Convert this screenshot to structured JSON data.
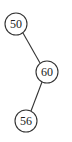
{
  "diagram": {
    "type": "binary-tree",
    "nodes": [
      {
        "id": "n50",
        "label": "50",
        "cx": 16,
        "cy": 24,
        "r": 11
      },
      {
        "id": "n60",
        "label": "60",
        "cx": 47,
        "cy": 72,
        "r": 11
      },
      {
        "id": "n56",
        "label": "56",
        "cx": 26,
        "cy": 121,
        "r": 11
      }
    ],
    "edges": [
      {
        "from": "n50",
        "to": "n60",
        "side": "right"
      },
      {
        "from": "n60",
        "to": "n56",
        "side": "left"
      }
    ]
  }
}
